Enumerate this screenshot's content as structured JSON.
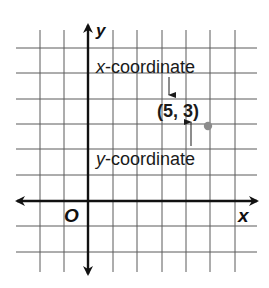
{
  "figure": {
    "type": "coordinate-plane",
    "axis_labels": {
      "x": "x",
      "y": "y",
      "origin": "O"
    },
    "point": {
      "label": "(5, 3)",
      "x": 5,
      "y": 3,
      "color": "#8c8c8c"
    },
    "annotations": {
      "x_coordinate": {
        "italic_var": "x",
        "rest": "-coordinate"
      },
      "y_coordinate": {
        "italic_var": "y",
        "rest": "-coordinate"
      }
    },
    "grid": {
      "vertical_x_px": [
        40,
        64,
        88,
        113,
        137,
        162,
        186,
        210,
        235
      ],
      "horizontal_y_px": [
        48,
        73,
        99,
        124,
        149,
        175,
        201,
        226,
        252
      ],
      "x_range_units": [
        -2,
        6
      ],
      "y_range_units": [
        -2,
        6
      ],
      "color": "#5a5a5a"
    },
    "colors": {
      "axis": "#111111",
      "text": "#1a1a1a",
      "background": "#ffffff"
    }
  }
}
